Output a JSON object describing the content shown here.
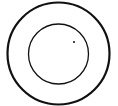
{
  "diagram": {
    "background": "#ffffff",
    "stroke_color": "#111111",
    "outer_circle": {
      "cx": 58.5,
      "cy": 53.5,
      "r": 51,
      "stroke_width": 2.2
    },
    "inner_circle": {
      "cx": 58.5,
      "cy": 54,
      "r": 30,
      "stroke_width": 1.3
    },
    "dot": {
      "cx": 74,
      "cy": 42,
      "r": 1
    }
  }
}
